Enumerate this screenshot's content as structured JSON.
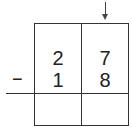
{
  "problem": {
    "operator": "−",
    "top_row": {
      "tens": "2",
      "ones": "7"
    },
    "bottom_row": {
      "tens": "1",
      "ones": "8"
    },
    "answer_row": {
      "tens": "",
      "ones": ""
    },
    "arrow_column": "ones"
  },
  "colors": {
    "line": "#333333",
    "text": "#222222",
    "background": "#ffffff"
  }
}
